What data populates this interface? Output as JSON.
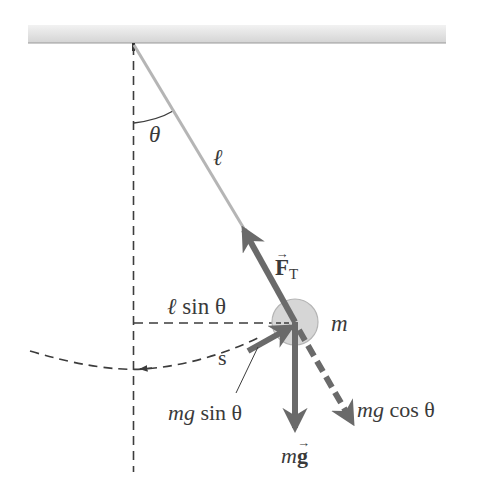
{
  "diagram": {
    "labels": {
      "theta": "θ",
      "length": "ℓ",
      "tension_symbol": "F",
      "tension_subscript": "T",
      "vector_arrow": "→",
      "horizontal_displacement": "ℓ sin θ",
      "horizontal_displacement_l": "ℓ",
      "horizontal_displacement_rest": " sin θ",
      "mass": "m",
      "arc_length": "s",
      "tangential_component_italic": "mg",
      "tangential_component_rest": " sin θ",
      "radial_component_italic": "mg",
      "radial_component_rest": " cos θ",
      "weight_italic": "m",
      "weight_vector": "g"
    },
    "colors": {
      "ceiling": "#d9d9d9",
      "string": "#b5b5b5",
      "arrow": "#6a6a6a",
      "bob_fill": "#d6d6d6",
      "bob_stroke": "#b0b0b0",
      "dashed": "#3c3c3c",
      "text": "#3a3a3a"
    },
    "geometry": {
      "pivot": [
        133,
        43
      ],
      "bob_center": [
        295,
        322
      ],
      "bob_radius": 23
    }
  }
}
